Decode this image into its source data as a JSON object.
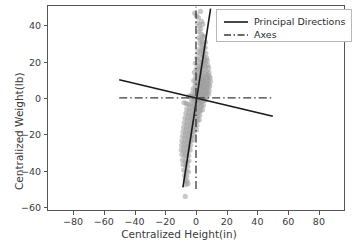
{
  "chart_data": {
    "type": "scatter",
    "title": "",
    "xlabel": "Centralized Height(in)",
    "ylabel": "Centralized Weight(lb)",
    "xlim": [
      -97,
      97
    ],
    "ylim": [
      -62,
      51
    ],
    "xticks": [
      -80,
      -60,
      -40,
      -20,
      0,
      20,
      40,
      60,
      80
    ],
    "yticks": [
      -60,
      -40,
      -20,
      0,
      20,
      40
    ],
    "xtick_labels": [
      "−80",
      "−60",
      "−40",
      "−20",
      "0",
      "20",
      "40",
      "60",
      "80"
    ],
    "ytick_labels": [
      "−60",
      "−40",
      "−20",
      "0",
      "20",
      "40"
    ],
    "grid": false,
    "legend_position": "upper right",
    "legend": [
      {
        "label": "Principal Directions",
        "style": "solid",
        "color": "#1a1a1a"
      },
      {
        "label": "Axes",
        "style": "dashdot",
        "color": "#3a3a3a"
      }
    ],
    "scatter": {
      "name": "Centralized data",
      "color": "#9a9a9a",
      "marker": "o",
      "size": 5.2,
      "alpha": 0.55,
      "points": [
        [
          -0.8,
          46.5
        ],
        [
          0.4,
          45.0
        ],
        [
          1.6,
          44.0
        ],
        [
          2.9,
          47.5
        ],
        [
          3.6,
          42.0
        ],
        [
          1.0,
          41.0
        ],
        [
          2.2,
          39.5
        ],
        [
          3.1,
          38.0
        ],
        [
          4.4,
          40.5
        ],
        [
          2.0,
          36.5
        ],
        [
          3.4,
          35.0
        ],
        [
          4.6,
          34.0
        ],
        [
          1.8,
          33.0
        ],
        [
          3.0,
          32.0
        ],
        [
          4.2,
          31.0
        ],
        [
          5.4,
          33.5
        ],
        [
          2.6,
          30.0
        ],
        [
          3.8,
          29.0
        ],
        [
          5.0,
          28.0
        ],
        [
          6.2,
          30.5
        ],
        [
          2.4,
          27.0
        ],
        [
          3.6,
          26.0
        ],
        [
          4.8,
          25.5
        ],
        [
          6.0,
          27.5
        ],
        [
          1.2,
          25.0
        ],
        [
          2.8,
          24.0
        ],
        [
          4.0,
          23.0
        ],
        [
          5.2,
          22.5
        ],
        [
          6.4,
          24.5
        ],
        [
          0.6,
          22.0
        ],
        [
          2.0,
          21.0
        ],
        [
          3.2,
          20.0
        ],
        [
          4.4,
          19.5
        ],
        [
          5.6,
          21.0
        ],
        [
          6.8,
          22.0
        ],
        [
          -0.4,
          19.0
        ],
        [
          1.4,
          18.0
        ],
        [
          2.6,
          17.5
        ],
        [
          3.8,
          17.0
        ],
        [
          5.0,
          18.5
        ],
        [
          6.2,
          19.5
        ],
        [
          7.4,
          20.5
        ],
        [
          0.2,
          16.0
        ],
        [
          1.6,
          15.5
        ],
        [
          2.8,
          15.0
        ],
        [
          4.0,
          14.5
        ],
        [
          5.2,
          16.0
        ],
        [
          6.4,
          17.0
        ],
        [
          7.6,
          18.0
        ],
        [
          -1.0,
          14.0
        ],
        [
          0.8,
          13.5
        ],
        [
          2.2,
          13.0
        ],
        [
          3.4,
          12.5
        ],
        [
          4.6,
          12.0
        ],
        [
          5.8,
          13.5
        ],
        [
          7.0,
          14.5
        ],
        [
          8.2,
          16.5
        ],
        [
          -0.2,
          11.5
        ],
        [
          1.2,
          11.0
        ],
        [
          2.4,
          10.5
        ],
        [
          3.6,
          10.0
        ],
        [
          4.8,
          10.5
        ],
        [
          6.0,
          11.5
        ],
        [
          7.2,
          12.5
        ],
        [
          8.4,
          14.0
        ],
        [
          -1.4,
          9.5
        ],
        [
          0.0,
          9.0
        ],
        [
          1.4,
          8.5
        ],
        [
          2.6,
          8.0
        ],
        [
          3.8,
          8.5
        ],
        [
          5.0,
          9.0
        ],
        [
          6.2,
          9.5
        ],
        [
          7.4,
          11.0
        ],
        [
          8.6,
          12.0
        ],
        [
          -0.6,
          7.0
        ],
        [
          0.8,
          6.5
        ],
        [
          2.0,
          6.0
        ],
        [
          3.2,
          6.5
        ],
        [
          4.4,
          7.0
        ],
        [
          5.6,
          7.5
        ],
        [
          6.8,
          8.5
        ],
        [
          8.0,
          9.5
        ],
        [
          9.2,
          11.0
        ],
        [
          -1.8,
          5.0
        ],
        [
          -0.4,
          4.5
        ],
        [
          1.0,
          4.0
        ],
        [
          2.2,
          4.5
        ],
        [
          3.4,
          5.0
        ],
        [
          4.6,
          5.5
        ],
        [
          5.8,
          6.0
        ],
        [
          7.0,
          6.5
        ],
        [
          8.2,
          7.5
        ],
        [
          9.4,
          9.0
        ],
        [
          -2.2,
          2.5
        ],
        [
          -0.8,
          2.0
        ],
        [
          0.6,
          2.0
        ],
        [
          1.8,
          2.5
        ],
        [
          3.0,
          3.0
        ],
        [
          4.2,
          3.5
        ],
        [
          5.4,
          4.0
        ],
        [
          6.6,
          4.5
        ],
        [
          7.8,
          5.5
        ],
        [
          9.0,
          6.5
        ],
        [
          -2.6,
          0.5
        ],
        [
          -1.2,
          0.0
        ],
        [
          0.2,
          0.0
        ],
        [
          1.4,
          0.5
        ],
        [
          2.6,
          1.0
        ],
        [
          3.8,
          1.5
        ],
        [
          5.0,
          2.0
        ],
        [
          6.2,
          2.5
        ],
        [
          7.4,
          3.0
        ],
        [
          8.6,
          4.0
        ],
        [
          -3.4,
          0.8
        ],
        [
          -4.6,
          1.0
        ],
        [
          -3.0,
          -1.5
        ],
        [
          -1.6,
          -2.0
        ],
        [
          -0.2,
          -2.0
        ],
        [
          1.0,
          -1.5
        ],
        [
          2.2,
          -1.0
        ],
        [
          3.4,
          -0.5
        ],
        [
          4.6,
          0.0
        ],
        [
          5.8,
          0.5
        ],
        [
          7.0,
          1.0
        ],
        [
          8.2,
          2.0
        ],
        [
          -5.2,
          -3.5
        ],
        [
          -3.8,
          -4.0
        ],
        [
          -2.4,
          -4.5
        ],
        [
          -1.0,
          -4.0
        ],
        [
          0.4,
          -3.5
        ],
        [
          1.6,
          -3.0
        ],
        [
          2.8,
          -2.5
        ],
        [
          4.0,
          -2.0
        ],
        [
          5.2,
          -1.5
        ],
        [
          6.4,
          -1.0
        ],
        [
          -6.0,
          -6.0
        ],
        [
          -4.4,
          -6.5
        ],
        [
          -3.0,
          -7.0
        ],
        [
          -1.6,
          -6.5
        ],
        [
          -0.2,
          -6.0
        ],
        [
          1.2,
          -5.5
        ],
        [
          2.4,
          -5.0
        ],
        [
          3.6,
          -4.5
        ],
        [
          4.8,
          -4.0
        ],
        [
          -6.6,
          -8.5
        ],
        [
          -5.0,
          -9.0
        ],
        [
          -3.6,
          -9.5
        ],
        [
          -2.2,
          -9.0
        ],
        [
          -0.8,
          -8.5
        ],
        [
          0.6,
          -8.0
        ],
        [
          1.8,
          -7.5
        ],
        [
          3.0,
          -7.0
        ],
        [
          4.2,
          -6.5
        ],
        [
          -7.2,
          -11.0
        ],
        [
          -5.6,
          -11.5
        ],
        [
          -4.2,
          -12.0
        ],
        [
          -2.8,
          -11.5
        ],
        [
          -1.4,
          -11.0
        ],
        [
          0.0,
          -10.5
        ],
        [
          1.2,
          -10.0
        ],
        [
          2.4,
          -9.5
        ],
        [
          -7.6,
          -13.5
        ],
        [
          -6.0,
          -14.0
        ],
        [
          -4.6,
          -14.5
        ],
        [
          -3.2,
          -14.0
        ],
        [
          -1.8,
          -13.5
        ],
        [
          -0.4,
          -13.0
        ],
        [
          1.0,
          -12.5
        ],
        [
          2.2,
          -12.0
        ],
        [
          -8.0,
          -16.0
        ],
        [
          -6.4,
          -16.5
        ],
        [
          -5.0,
          -17.0
        ],
        [
          -3.6,
          -16.5
        ],
        [
          -2.2,
          -16.0
        ],
        [
          -0.8,
          -15.5
        ],
        [
          0.6,
          -15.0
        ],
        [
          -8.4,
          -18.5
        ],
        [
          -6.8,
          -19.0
        ],
        [
          -5.4,
          -19.5
        ],
        [
          -4.0,
          -19.0
        ],
        [
          -2.6,
          -18.5
        ],
        [
          -1.2,
          -18.0
        ],
        [
          0.2,
          -17.5
        ],
        [
          -8.8,
          -21.0
        ],
        [
          -7.2,
          -21.5
        ],
        [
          -5.8,
          -22.0
        ],
        [
          -4.4,
          -21.5
        ],
        [
          -3.0,
          -21.0
        ],
        [
          -1.6,
          -20.5
        ],
        [
          -9.2,
          -23.5
        ],
        [
          -7.6,
          -24.0
        ],
        [
          -6.2,
          -24.5
        ],
        [
          -4.8,
          -24.0
        ],
        [
          -3.4,
          -23.5
        ],
        [
          -2.0,
          -23.0
        ],
        [
          -9.4,
          -26.0
        ],
        [
          -7.8,
          -26.5
        ],
        [
          -6.4,
          -27.0
        ],
        [
          -5.0,
          -26.5
        ],
        [
          -3.6,
          -26.0
        ],
        [
          -9.6,
          -28.5
        ],
        [
          -8.0,
          -29.0
        ],
        [
          -6.6,
          -29.5
        ],
        [
          -5.2,
          -29.0
        ],
        [
          -3.8,
          -28.5
        ],
        [
          -9.2,
          -31.0
        ],
        [
          -7.6,
          -31.5
        ],
        [
          -6.2,
          -32.0
        ],
        [
          -4.8,
          -31.5
        ],
        [
          -8.8,
          -34.0
        ],
        [
          -7.2,
          -34.5
        ],
        [
          -5.8,
          -35.0
        ],
        [
          -4.6,
          -34.5
        ],
        [
          -8.4,
          -36.5
        ],
        [
          -6.8,
          -37.0
        ],
        [
          -5.4,
          -37.5
        ],
        [
          -8.0,
          -39.5
        ],
        [
          -6.4,
          -40.0
        ],
        [
          -5.0,
          -40.5
        ],
        [
          -7.4,
          -42.5
        ],
        [
          -6.0,
          -43.0
        ],
        [
          -7.0,
          -45.0
        ],
        [
          -5.8,
          -45.5
        ],
        [
          -6.6,
          -47.5
        ],
        [
          -5.2,
          -47.0
        ],
        [
          -7.0,
          -54.0
        ],
        [
          -7.8,
          -2.5
        ],
        [
          -6.4,
          -3.0
        ]
      ]
    },
    "lines": [
      {
        "name": "principal-direction-1",
        "label": "Principal Directions",
        "style": "solid",
        "color": "#1a1a1a",
        "width": 1.6,
        "x": [
          -8.5,
          9.5
        ],
        "y": [
          -49.0,
          49.0
        ]
      },
      {
        "name": "principal-direction-2",
        "label": "Principal Directions",
        "style": "solid",
        "color": "#1a1a1a",
        "width": 1.6,
        "x": [
          -50.0,
          50.0
        ],
        "y": [
          10.0,
          -10.0
        ]
      },
      {
        "name": "axis-horizontal",
        "label": "Axes",
        "style": "dashdot",
        "color": "#3a3a3a",
        "width": 1.3,
        "x": [
          -50.0,
          50.0
        ],
        "y": [
          0.0,
          0.0
        ]
      },
      {
        "name": "axis-vertical",
        "label": "Axes",
        "style": "dashdot",
        "color": "#3a3a3a",
        "width": 1.3,
        "x": [
          0.0,
          0.0
        ],
        "y": [
          -50.0,
          50.0
        ]
      }
    ]
  }
}
